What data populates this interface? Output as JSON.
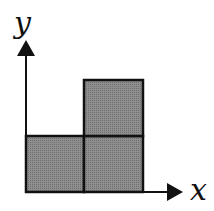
{
  "diagram": {
    "x_axis_label": "x",
    "y_axis_label": "y",
    "fill_color": "#8a8a8a",
    "stroke_color": "#111111",
    "squares": [
      {
        "col": 0,
        "row": 0
      },
      {
        "col": 1,
        "row": 0
      },
      {
        "col": 1,
        "row": 1
      }
    ]
  }
}
